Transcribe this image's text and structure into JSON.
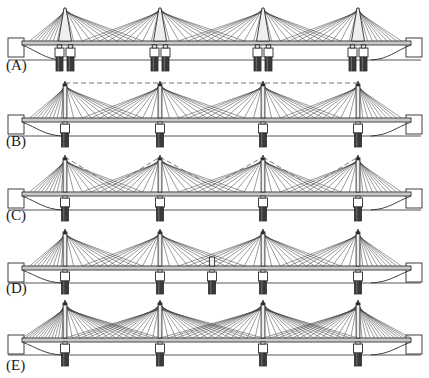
{
  "figure": {
    "type": "diagram",
    "width": 429,
    "height": 378,
    "background_color": "#ffffff",
    "line_color": "#2b2b2b",
    "cable_color": "#4a4a4a",
    "deck_fill": "#d7d7d7",
    "pier_fill": "#3a3a3a",
    "pier_cap_fill": "#ffffff",
    "dashed_color": "#6b6b6b"
  },
  "panels": [
    {
      "id": "A",
      "label": "(A)",
      "label_x": 6,
      "label_y": 70,
      "baseline_y": 41,
      "ground_y": 60,
      "deck_thickness": 4,
      "pylon_top_y": 8,
      "pylon_style": "a-frame-twin-leg",
      "pylon_count": 4,
      "pier_count_per_pylon": 2,
      "pier_pair_offset": 9,
      "pier_base_y": 71,
      "pier_cap_y": 48,
      "cables_per_side": 9,
      "cable_span_ratio": 0.82,
      "dashed_overlay": "none",
      "extra_mid_pier": false,
      "pylon_x": [
        65,
        160,
        263,
        358
      ],
      "abutment_left_x": 14,
      "abutment_right_x": 404,
      "deck_left_x": 22,
      "deck_right_x": 411,
      "description": "A-frame pylons with twin legs straddling the deck, each supported on a pair of piers"
    },
    {
      "id": "B",
      "label": "(B)",
      "label_x": 6,
      "label_y": 146,
      "baseline_y": 118,
      "ground_y": 136,
      "deck_thickness": 4,
      "pylon_top_y": 84,
      "pylon_style": "single-mast",
      "pylon_count": 4,
      "pier_count_per_pylon": 1,
      "pier_pair_offset": 0,
      "pier_base_y": 147,
      "pier_cap_y": 124,
      "cables_per_side": 9,
      "cable_span_ratio": 0.82,
      "dashed_overlay": "horizontal-tie",
      "extra_mid_pier": false,
      "pylon_x": [
        65,
        160,
        263,
        358
      ],
      "abutment_left_x": 14,
      "abutment_right_x": 404,
      "deck_left_x": 22,
      "deck_right_x": 411,
      "description": "Single central mast pylons on single piers, with a dashed horizontal tie line linking all pylon tops"
    },
    {
      "id": "C",
      "label": "(C)",
      "label_x": 6,
      "label_y": 220,
      "baseline_y": 192,
      "ground_y": 210,
      "deck_thickness": 4,
      "pylon_top_y": 158,
      "pylon_style": "single-mast",
      "pylon_count": 4,
      "pier_count_per_pylon": 1,
      "pier_pair_offset": 0,
      "pier_base_y": 221,
      "pier_cap_y": 198,
      "cables_per_side": 9,
      "cable_span_ratio": 0.82,
      "dashed_overlay": "zigzag-midspan",
      "dashed_dip_y": 186,
      "extra_mid_pier": false,
      "pylon_x": [
        65,
        160,
        263,
        358
      ],
      "abutment_left_x": 14,
      "abutment_right_x": 404,
      "deck_left_x": 22,
      "deck_right_x": 411,
      "description": "Single mast pylons with dashed zigzag stay lines dipping to mid-span between pylon tops"
    },
    {
      "id": "D",
      "label": "(D)",
      "label_x": 6,
      "label_y": 293,
      "baseline_y": 266,
      "ground_y": 283,
      "deck_thickness": 4,
      "pylon_top_y": 232,
      "pylon_style": "single-mast",
      "pylon_count": 4,
      "pier_count_per_pylon": 1,
      "pier_pair_offset": 0,
      "pier_base_y": 294,
      "pier_cap_y": 272,
      "cables_per_side": 9,
      "cable_span_ratio": 0.82,
      "dashed_overlay": "none",
      "extra_mid_pier": true,
      "mid_pier_x": 212,
      "pylon_x": [
        65,
        160,
        263,
        358
      ],
      "abutment_left_x": 14,
      "abutment_right_x": 404,
      "deck_left_x": 22,
      "deck_right_x": 411,
      "description": "Single mast pylons plus an additional intermediate pier at mid-span with a short stub above the deck"
    },
    {
      "id": "E",
      "label": "(E)",
      "label_x": 6,
      "label_y": 370,
      "baseline_y": 338,
      "ground_y": 355,
      "deck_thickness": 4,
      "pylon_top_y": 303,
      "pylon_style": "single-mast",
      "pylon_count": 4,
      "pier_count_per_pylon": 1,
      "pier_pair_offset": 0,
      "pier_base_y": 366,
      "pier_cap_y": 344,
      "cables_per_side": 13,
      "cable_span_ratio": 1.0,
      "dashed_overlay": "none",
      "extra_mid_pier": false,
      "pylon_x": [
        65,
        160,
        263,
        358
      ],
      "abutment_left_x": 14,
      "abutment_right_x": 404,
      "deck_left_x": 22,
      "deck_right_x": 411,
      "description": "Single mast pylons with dense full-span cable fans that overlap at mid-span"
    }
  ]
}
